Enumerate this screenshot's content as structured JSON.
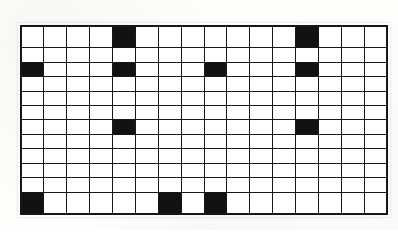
{
  "document": {
    "kind": "scanned-grid-pattern",
    "background_color": "#fdfdfb",
    "paper_color": "#ffffff"
  },
  "grid": {
    "columns": 16,
    "rows": 12,
    "line_color": "#161616",
    "cell_empty_color": "#ffffff",
    "cell_filled_color": "#121212",
    "border_width_px": 2,
    "line_width_px": 1.6,
    "origin_x_px": 20,
    "origin_y_px": 25,
    "width_px": 368,
    "height_px": 190,
    "filled_cells": [
      [
        1,
        5
      ],
      [
        1,
        13
      ],
      [
        3,
        1
      ],
      [
        3,
        5
      ],
      [
        3,
        9
      ],
      [
        3,
        13
      ],
      [
        7,
        5
      ],
      [
        7,
        13
      ],
      [
        12,
        1
      ],
      [
        12,
        7
      ],
      [
        12,
        9
      ]
    ],
    "row_summaries": [
      {
        "row": 1,
        "filled_columns": [
          5,
          13
        ]
      },
      {
        "row": 2,
        "filled_columns": []
      },
      {
        "row": 3,
        "filled_columns": [
          1,
          5,
          9,
          13
        ]
      },
      {
        "row": 4,
        "filled_columns": []
      },
      {
        "row": 5,
        "filled_columns": []
      },
      {
        "row": 6,
        "filled_columns": []
      },
      {
        "row": 7,
        "filled_columns": [
          5,
          13
        ]
      },
      {
        "row": 8,
        "filled_columns": []
      },
      {
        "row": 9,
        "filled_columns": []
      },
      {
        "row": 10,
        "filled_columns": []
      },
      {
        "row": 11,
        "filled_columns": []
      },
      {
        "row": 12,
        "filled_columns": [
          1,
          7,
          9
        ]
      }
    ]
  }
}
